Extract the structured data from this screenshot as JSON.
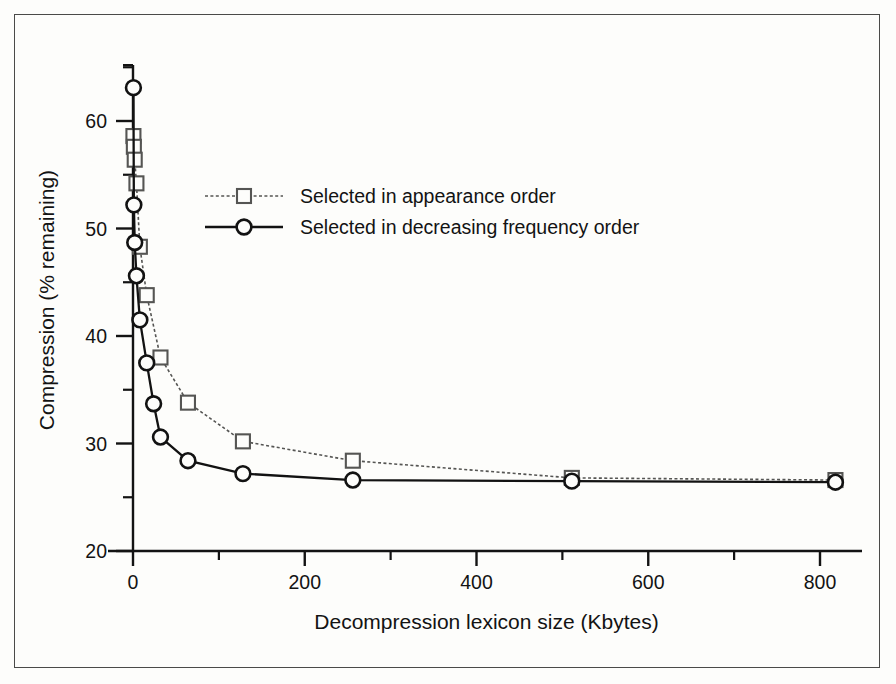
{
  "figure": {
    "background_color": "#fdfdfb",
    "frame_color": "#4a4a48",
    "ink_color": "#131313"
  },
  "axes": {
    "x_label": "Decompression lexicon size (Kbytes)",
    "y_label": "Compression (% remaining)",
    "x_ticks": [
      "0",
      "200",
      "400",
      "600",
      "800"
    ],
    "y_ticks": [
      "20",
      "30",
      "40",
      "50",
      "60"
    ]
  },
  "legend": {
    "entries": [
      {
        "label": "Selected in appearance order",
        "marker": "square-marker",
        "line_style": "dotted",
        "color": "#555553"
      },
      {
        "label": "Selected in decreasing frequency order",
        "marker": "circle-marker",
        "line_style": "solid",
        "color": "#121212"
      }
    ]
  },
  "chart_data": {
    "type": "line",
    "title": "",
    "subtitle": "",
    "xlabel": "Decompression lexicon size (Kbytes)",
    "ylabel": "Compression (% remaining)",
    "xlim": [
      -18,
      865
    ],
    "ylim": [
      20,
      65
    ],
    "xticks": [
      0,
      200,
      400,
      600,
      800
    ],
    "yticks": [
      20,
      30,
      40,
      50,
      60
    ],
    "x_minor_ticks": [
      100,
      300,
      500,
      700
    ],
    "y_minor_ticks": [
      25,
      35,
      45,
      55,
      65
    ],
    "grid": false,
    "legend_position": "upper-center-left",
    "series": [
      {
        "name": "Selected in appearance order",
        "marker": "square",
        "line_style": "dotted",
        "color": "#555553",
        "points": [
          {
            "x": 0.5,
            "y": 58.6
          },
          {
            "x": 1,
            "y": 57.6
          },
          {
            "x": 2,
            "y": 56.4
          },
          {
            "x": 4,
            "y": 54.2
          },
          {
            "x": 8,
            "y": 48.3
          },
          {
            "x": 16,
            "y": 43.8
          },
          {
            "x": 32,
            "y": 38.0
          },
          {
            "x": 64,
            "y": 33.8
          },
          {
            "x": 128,
            "y": 30.2
          },
          {
            "x": 256,
            "y": 28.4
          },
          {
            "x": 511,
            "y": 26.8
          },
          {
            "x": 818,
            "y": 26.6
          }
        ]
      },
      {
        "name": "Selected in decreasing frequency order",
        "marker": "circle",
        "line_style": "solid",
        "color": "#121212",
        "points": [
          {
            "x": 0.5,
            "y": 63.1
          },
          {
            "x": 1,
            "y": 52.2
          },
          {
            "x": 2,
            "y": 48.7
          },
          {
            "x": 4,
            "y": 45.6
          },
          {
            "x": 8,
            "y": 41.5
          },
          {
            "x": 16,
            "y": 37.5
          },
          {
            "x": 24,
            "y": 33.7
          },
          {
            "x": 32,
            "y": 30.6
          },
          {
            "x": 64,
            "y": 28.4
          },
          {
            "x": 128,
            "y": 27.2
          },
          {
            "x": 256,
            "y": 26.6
          },
          {
            "x": 511,
            "y": 26.5
          },
          {
            "x": 818,
            "y": 26.4
          }
        ]
      }
    ]
  }
}
